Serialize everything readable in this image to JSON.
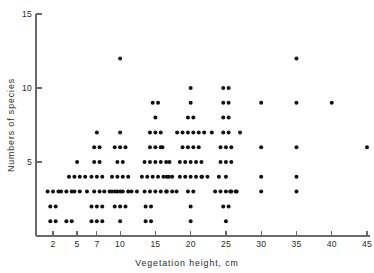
{
  "chart_data": {
    "type": "scatter",
    "title": "",
    "xlabel": "Vegetation height, cm",
    "ylabel": "Numbers of species",
    "xtick_labels": [
      "2",
      "5",
      "7",
      "10",
      "15",
      "20",
      "25",
      "30",
      "35",
      "40",
      "45"
    ],
    "xtick_values": [
      2,
      5,
      7,
      10,
      15,
      20,
      25,
      30,
      35,
      40,
      45
    ],
    "ytick_labels": [
      "5",
      "10",
      "15"
    ],
    "ytick_values": [
      5,
      10,
      15
    ],
    "xlim": [
      0,
      46
    ],
    "ylim": [
      0,
      15
    ],
    "grid": false,
    "legend": "none",
    "note": "Each plotted marker is one observation; markers sharing an (x,y) bin are drawn side by side as a horizontal run.",
    "bins": [
      {
        "x": 2,
        "y": 1,
        "count": 2
      },
      {
        "x": 2,
        "y": 2,
        "count": 2
      },
      {
        "x": 2,
        "y": 3,
        "count": 3
      },
      {
        "x": 3,
        "y": 3,
        "count": 1
      },
      {
        "x": 4,
        "y": 1,
        "count": 2
      },
      {
        "x": 4,
        "y": 3,
        "count": 2
      },
      {
        "x": 5,
        "y": 3,
        "count": 2
      },
      {
        "x": 5,
        "y": 4,
        "count": 4
      },
      {
        "x": 5,
        "y": 5,
        "count": 1
      },
      {
        "x": 6,
        "y": 3,
        "count": 1
      },
      {
        "x": 7,
        "y": 1,
        "count": 3
      },
      {
        "x": 7,
        "y": 2,
        "count": 3
      },
      {
        "x": 7,
        "y": 3,
        "count": 2
      },
      {
        "x": 7,
        "y": 4,
        "count": 3
      },
      {
        "x": 7,
        "y": 5,
        "count": 2
      },
      {
        "x": 7,
        "y": 6,
        "count": 2
      },
      {
        "x": 7,
        "y": 7,
        "count": 1
      },
      {
        "x": 9,
        "y": 3,
        "count": 4
      },
      {
        "x": 10,
        "y": 1,
        "count": 1
      },
      {
        "x": 10,
        "y": 2,
        "count": 3
      },
      {
        "x": 10,
        "y": 3,
        "count": 4
      },
      {
        "x": 10,
        "y": 4,
        "count": 4
      },
      {
        "x": 10,
        "y": 5,
        "count": 2
      },
      {
        "x": 10,
        "y": 6,
        "count": 3
      },
      {
        "x": 10,
        "y": 7,
        "count": 1
      },
      {
        "x": 10,
        "y": 12,
        "count": 1
      },
      {
        "x": 12,
        "y": 3,
        "count": 2
      },
      {
        "x": 14,
        "y": 1,
        "count": 2
      },
      {
        "x": 14,
        "y": 2,
        "count": 2
      },
      {
        "x": 15,
        "y": 3,
        "count": 5
      },
      {
        "x": 15,
        "y": 4,
        "count": 6
      },
      {
        "x": 15,
        "y": 5,
        "count": 5
      },
      {
        "x": 15,
        "y": 6,
        "count": 3
      },
      {
        "x": 15,
        "y": 7,
        "count": 3
      },
      {
        "x": 15,
        "y": 8,
        "count": 1
      },
      {
        "x": 15,
        "y": 9,
        "count": 2
      },
      {
        "x": 16,
        "y": 6,
        "count": 1
      },
      {
        "x": 17,
        "y": 3,
        "count": 2
      },
      {
        "x": 17,
        "y": 4,
        "count": 2
      },
      {
        "x": 17,
        "y": 5,
        "count": 1
      },
      {
        "x": 18,
        "y": 3,
        "count": 1
      },
      {
        "x": 20,
        "y": 1,
        "count": 1
      },
      {
        "x": 20,
        "y": 2,
        "count": 1
      },
      {
        "x": 20,
        "y": 3,
        "count": 2
      },
      {
        "x": 20,
        "y": 4,
        "count": 5
      },
      {
        "x": 20,
        "y": 5,
        "count": 5
      },
      {
        "x": 20,
        "y": 6,
        "count": 4
      },
      {
        "x": 20,
        "y": 7,
        "count": 6
      },
      {
        "x": 20,
        "y": 8,
        "count": 2
      },
      {
        "x": 20,
        "y": 9,
        "count": 1
      },
      {
        "x": 20,
        "y": 10,
        "count": 1
      },
      {
        "x": 22,
        "y": 4,
        "count": 2
      },
      {
        "x": 23,
        "y": 7,
        "count": 1
      },
      {
        "x": 24,
        "y": 4,
        "count": 1
      },
      {
        "x": 25,
        "y": 1,
        "count": 1
      },
      {
        "x": 25,
        "y": 2,
        "count": 2
      },
      {
        "x": 25,
        "y": 3,
        "count": 5
      },
      {
        "x": 25,
        "y": 4,
        "count": 1
      },
      {
        "x": 25,
        "y": 5,
        "count": 3
      },
      {
        "x": 25,
        "y": 6,
        "count": 3
      },
      {
        "x": 25,
        "y": 7,
        "count": 2
      },
      {
        "x": 25,
        "y": 8,
        "count": 2
      },
      {
        "x": 25,
        "y": 9,
        "count": 2
      },
      {
        "x": 25,
        "y": 10,
        "count": 2
      },
      {
        "x": 26,
        "y": 3,
        "count": 2
      },
      {
        "x": 27,
        "y": 7,
        "count": 1
      },
      {
        "x": 30,
        "y": 3,
        "count": 1
      },
      {
        "x": 30,
        "y": 4,
        "count": 1
      },
      {
        "x": 30,
        "y": 6,
        "count": 1
      },
      {
        "x": 30,
        "y": 9,
        "count": 1
      },
      {
        "x": 35,
        "y": 3,
        "count": 1
      },
      {
        "x": 35,
        "y": 4,
        "count": 1
      },
      {
        "x": 35,
        "y": 6,
        "count": 1
      },
      {
        "x": 35,
        "y": 9,
        "count": 1
      },
      {
        "x": 35,
        "y": 12,
        "count": 1
      },
      {
        "x": 40,
        "y": 9,
        "count": 1
      },
      {
        "x": 45,
        "y": 6,
        "count": 1
      }
    ]
  },
  "figure": {
    "marker_radius_px": 2.0,
    "marker_color": "#101010",
    "axis_color": "#6a6a6a",
    "background_color": "#ffffff"
  }
}
